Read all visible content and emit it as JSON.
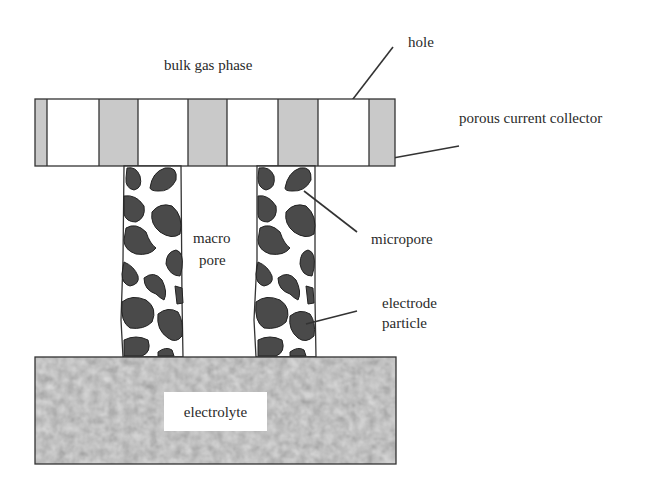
{
  "diagram": {
    "type": "schematic",
    "colors": {
      "background": "#ffffff",
      "outline": "#333333",
      "collector_solid": "#c9c9c9",
      "hole": "#ffffff",
      "particle": "#4a4a4a",
      "electrolyte_base": "#a3a3a3",
      "label_text": "#2a2a2a"
    },
    "labels": {
      "bulk_gas_phase": "bulk gas phase",
      "hole": "hole",
      "porous_current_collector": "porous current collector",
      "macro_line1": "macro",
      "macro_line2": "pore",
      "micropore": "micropore",
      "electrode_line1": "electrode",
      "electrode_line2": "particle",
      "electrolyte": "electrolyte"
    },
    "components": [
      {
        "id": "current-collector",
        "label": "porous current collector",
        "segments": [
          "solid",
          "hole",
          "solid",
          "hole",
          "solid",
          "hole",
          "solid",
          "hole",
          "solid"
        ]
      },
      {
        "id": "electrode-pillar-left",
        "contains": "electrode particles"
      },
      {
        "id": "macropore",
        "label": "macro pore"
      },
      {
        "id": "electrode-pillar-right",
        "contains": "electrode particles"
      },
      {
        "id": "electrolyte-layer",
        "label": "electrolyte"
      }
    ],
    "annotations": [
      {
        "text": "hole",
        "points_to": "current collector hole"
      },
      {
        "text": "porous current collector",
        "points_to": "collector solid segment"
      },
      {
        "text": "micropore",
        "points_to": "gap between particles"
      },
      {
        "text": "electrode particle",
        "points_to": "dark particle in pillar"
      }
    ]
  }
}
